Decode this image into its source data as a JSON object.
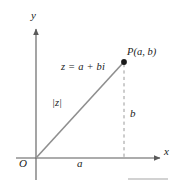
{
  "figure": {
    "type": "argand-diagram",
    "colors": {
      "axis": "#5a5a5a",
      "vector": "#8a8a8a",
      "dashed": "#9a9a9a",
      "point": "#1a1a1a",
      "text": "#1a1a1a",
      "rule": "#9a9a9a",
      "background": "#ffffff"
    },
    "axes": {
      "x_label": "x",
      "y_label": "y",
      "origin_label": "O"
    },
    "labels": {
      "point": "P(a, b)",
      "complex_number": "z = a + bi",
      "modulus": "|z|",
      "real_part": "a",
      "imaginary_part": "b"
    },
    "geometry": {
      "origin_px": [
        36,
        158
      ],
      "point_px": [
        124,
        62
      ],
      "x_axis_from_px": [
        16,
        158
      ],
      "x_axis_to_px": [
        163,
        158
      ],
      "y_axis_from_px": [
        36,
        180
      ],
      "y_axis_to_px": [
        36,
        26
      ]
    }
  }
}
